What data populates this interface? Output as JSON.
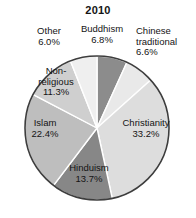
{
  "chart_data": {
    "type": "pie",
    "title": "2010",
    "xlabel": "",
    "ylabel": "",
    "legend_position": "none",
    "grid": false,
    "unit": "%",
    "categories": [
      "Buddhism",
      "Chinese traditional",
      "Christianity",
      "Hinduism",
      "Islam",
      "Non-religious",
      "Other"
    ],
    "values": [
      6.8,
      6.6,
      33.2,
      13.7,
      22.4,
      11.3,
      6.0
    ],
    "slices": [
      {
        "name": "buddhism",
        "label": "Buddhism",
        "value": 6.8,
        "value_label": "6.8%",
        "label_text": "Buddhism\n6.8%",
        "color": "#8c8c8c",
        "label_placement": "outside-top"
      },
      {
        "name": "chinese-traditional",
        "label": "Chinese traditional",
        "value": 6.6,
        "value_label": "6.6%",
        "label_text": "Chinese\ntraditional\n6.6%",
        "color": "#e9e9e9",
        "label_placement": "outside-right"
      },
      {
        "name": "christianity",
        "label": "Christianity",
        "value": 33.2,
        "value_label": "33.2%",
        "label_text": "Christianity\n33.2%",
        "color": "#dddddd",
        "label_placement": "inside"
      },
      {
        "name": "hinduism",
        "label": "Hinduism",
        "value": 13.7,
        "value_label": "13.7%",
        "label_text": "Hinduism\n13.7%",
        "color": "#878787",
        "label_placement": "inside"
      },
      {
        "name": "islam",
        "label": "Islam",
        "value": 22.4,
        "value_label": "22.4%",
        "label_text": "Islam\n22.4%",
        "color": "#bebebe",
        "label_placement": "inside"
      },
      {
        "name": "non-religious",
        "label": "Non-religious",
        "value": 11.3,
        "value_label": "11.3%",
        "label_text": "Non-\nreligious\n11.3%",
        "color": "#cfcfcf",
        "label_placement": "inside"
      },
      {
        "name": "other",
        "label": "Other",
        "value": 6.0,
        "value_label": "6.0%",
        "label_text": "Other\n6.0%",
        "color": "#efefef",
        "label_placement": "outside-top"
      }
    ]
  },
  "style": {
    "background": "#ffffff",
    "outline_color": "#3d3d3d",
    "separator_color": "#ffffff",
    "text_color": "#141414"
  }
}
